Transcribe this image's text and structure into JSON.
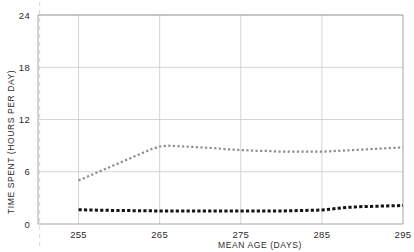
{
  "chart_data": {
    "type": "line",
    "title": "",
    "xlabel": "MEAN AGE (DAYS)",
    "ylabel": "TIME SPENT (HOURS PER DAY)",
    "xlim": [
      250,
      295
    ],
    "ylim": [
      0,
      24
    ],
    "xticks": [
      255,
      265,
      275,
      285,
      295
    ],
    "yticks": [
      0,
      6,
      12,
      18,
      24
    ],
    "xtick_labels": [
      "255",
      "265",
      "275",
      "285",
      "295"
    ],
    "ytick_labels": [
      "0",
      "6",
      "12",
      "18",
      "24"
    ],
    "grid": true,
    "legend": "none",
    "annotations": [
      {
        "name": "reference-dashed-line",
        "type": "vline",
        "x": 250.2,
        "style": "dashed",
        "color": "#d9d9d9"
      }
    ],
    "series": [
      {
        "name": "upper-series",
        "style": "dotted",
        "color": "#8c8c8c",
        "marker": "square",
        "x": [
          255.0,
          256.0,
          257.0,
          258.0,
          259.0,
          260.0,
          261.0,
          262.0,
          263.0,
          264.0,
          265.0,
          266.0,
          267.0,
          268.0,
          269.0,
          270.0,
          271.0,
          272.0,
          273.0,
          274.0,
          275.0,
          276.0,
          277.0,
          278.0,
          279.0,
          280.0,
          281.0,
          282.0,
          283.0,
          284.0,
          285.0,
          286.0,
          287.0,
          288.0,
          289.0,
          290.0,
          291.0,
          292.0,
          293.0,
          294.0,
          295.0
        ],
        "values": [
          5.0,
          5.4,
          5.8,
          6.2,
          6.6,
          7.0,
          7.4,
          7.8,
          8.2,
          8.6,
          8.9,
          9.0,
          8.95,
          8.9,
          8.85,
          8.8,
          8.75,
          8.7,
          8.6,
          8.55,
          8.5,
          8.45,
          8.4,
          8.4,
          8.35,
          8.3,
          8.3,
          8.3,
          8.3,
          8.3,
          8.3,
          8.35,
          8.4,
          8.45,
          8.5,
          8.55,
          8.6,
          8.65,
          8.7,
          8.75,
          8.8
        ]
      },
      {
        "name": "lower-series",
        "style": "dotted",
        "color": "#141414",
        "marker": "square",
        "x": [
          255.0,
          256.0,
          257.0,
          258.0,
          259.0,
          260.0,
          261.0,
          262.0,
          263.0,
          264.0,
          265.0,
          266.0,
          267.0,
          268.0,
          269.0,
          270.0,
          271.0,
          272.0,
          273.0,
          274.0,
          275.0,
          276.0,
          277.0,
          278.0,
          279.0,
          280.0,
          281.0,
          282.0,
          283.0,
          284.0,
          285.0,
          286.0,
          287.0,
          288.0,
          289.0,
          290.0,
          291.0,
          292.0,
          293.0,
          294.0,
          295.0
        ],
        "values": [
          1.65,
          1.62,
          1.6,
          1.58,
          1.56,
          1.55,
          1.54,
          1.53,
          1.52,
          1.51,
          1.5,
          1.5,
          1.5,
          1.5,
          1.5,
          1.5,
          1.5,
          1.5,
          1.5,
          1.5,
          1.5,
          1.5,
          1.5,
          1.5,
          1.5,
          1.5,
          1.52,
          1.54,
          1.56,
          1.58,
          1.6,
          1.7,
          1.8,
          1.9,
          1.95,
          2.0,
          2.02,
          2.05,
          2.08,
          2.1,
          2.12
        ]
      }
    ]
  },
  "colors": {
    "axis": "#9a9a9a",
    "grid": "#c9c9c9",
    "dashed_guide": "#dcdcdc",
    "series_upper": "#8c8c8c",
    "series_lower": "#141414",
    "text": "#2b2b2b",
    "background": "#ffffff"
  }
}
